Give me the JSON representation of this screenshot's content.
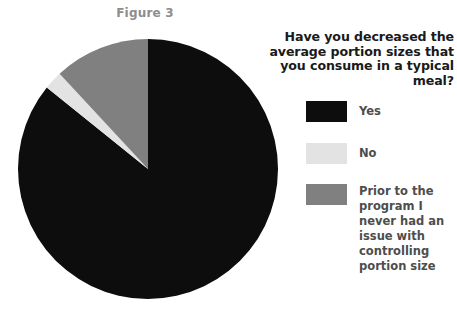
{
  "figure": {
    "caption": "Figure 3"
  },
  "legend": {
    "title": "Have you decreased the\naverage portion sizes\nthat you consume in a\ntypical meal?",
    "items": [
      {
        "label": "Yes",
        "color": "#0d0d0d"
      },
      {
        "label": "No",
        "color": "#e3e3e3"
      },
      {
        "label": "Prior to the\nprogram I\nnever had an\nissue with\ncontrolling\nportion size",
        "color": "#808080"
      }
    ]
  },
  "chart_data": {
    "type": "pie",
    "title": "Figure 3",
    "question": "Have you decreased the average portion sizes that you consume in a typical meal?",
    "categories": [
      "Yes",
      "No",
      "Prior to the program I never had an issue with controlling portion size"
    ],
    "values": [
      85.8,
      2.3,
      11.9
    ],
    "value_unit": "percent",
    "colors": [
      "#0d0d0d",
      "#e3e3e3",
      "#808080"
    ],
    "start_angle_deg": 0,
    "direction": "clockwise",
    "legend_position": "right",
    "labels_shown": false,
    "grid": false
  },
  "geometry": {
    "center_x": 131,
    "center_y": 131,
    "radius": 130
  },
  "colors": {
    "background": "#ffffff",
    "caption_text": "#8d8d8d",
    "title_text": "#1a1a1a",
    "legend_text": "#4d4d4d"
  }
}
